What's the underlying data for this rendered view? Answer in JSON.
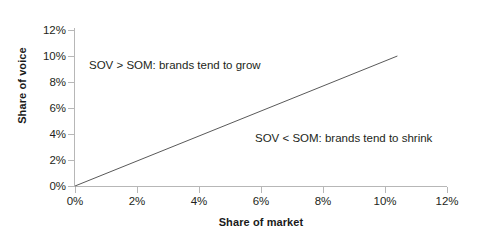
{
  "chart_data": {
    "type": "line",
    "title": "",
    "subtitle": "",
    "xlabel": "Share of market",
    "ylabel": "Share of voice",
    "xlim": [
      0,
      12
    ],
    "ylim": [
      0,
      12
    ],
    "grid": false,
    "legend": "none",
    "x_tick_labels": [
      "0%",
      "2%",
      "4%",
      "6%",
      "8%",
      "10%",
      "12%"
    ],
    "x_tick_values": [
      0,
      2,
      4,
      6,
      8,
      10,
      12
    ],
    "y_tick_labels": [
      "0%",
      "2%",
      "4%",
      "6%",
      "8%",
      "10%",
      "12%"
    ],
    "y_tick_values": [
      0,
      2,
      4,
      6,
      8,
      10,
      12
    ],
    "series": [
      {
        "name": "SOV = SOM parity line",
        "x": [
          0,
          10.4
        ],
        "y": [
          0,
          10.0
        ],
        "color": "#595959",
        "width": 1
      }
    ],
    "annotations": [
      {
        "id": "grow",
        "text": "SOV > SOM: brands tend to grow",
        "x": 0.45,
        "y": 8.7
      },
      {
        "id": "shrink",
        "text": "SOV < SOM: brands tend to shrink",
        "x": 5.8,
        "y": 3.1
      }
    ],
    "axis_color": "#b7b7b7",
    "text_color": "#231f20",
    "background": "#ffffff"
  },
  "axes": {
    "y_title": "Share of voice",
    "x_title": "Share of market"
  },
  "y_labels": {
    "t0": "0%",
    "t1": "2%",
    "t2": "4%",
    "t3": "6%",
    "t4": "8%",
    "t5": "10%",
    "t6": "12%"
  },
  "x_labels": {
    "t0": "0%",
    "t1": "2%",
    "t2": "4%",
    "t3": "6%",
    "t4": "8%",
    "t5": "10%",
    "t6": "12%"
  },
  "annotations": {
    "grow": "SOV > SOM: brands tend to grow",
    "shrink": "SOV < SOM: brands tend to shrink"
  }
}
